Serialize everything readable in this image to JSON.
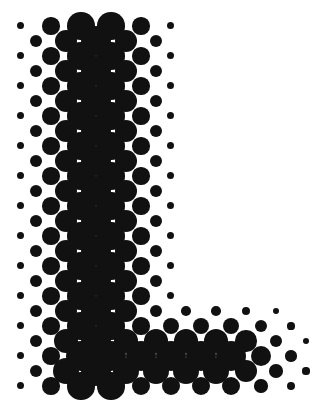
{
  "figure": {
    "title": "Halftone letter L",
    "letter": "L",
    "ink_color": "#111111",
    "paper_color": "#ffffff",
    "width": 315,
    "height": 417,
    "grid": {
      "pitch": 15,
      "origin_x": 6,
      "origin_y": 11,
      "pattern": "diagonal-checker"
    },
    "stem": {
      "center_x": 96,
      "half_width": 42,
      "top": 18,
      "bottom": 395
    },
    "foot": {
      "center_y": 358,
      "half_height": 30,
      "left": 60,
      "right": 300
    }
  }
}
